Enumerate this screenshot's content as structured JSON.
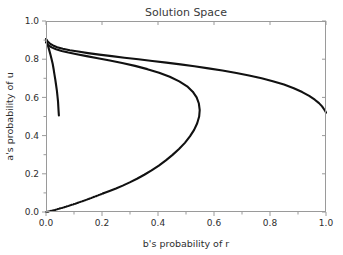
{
  "chart_data": {
    "type": "line",
    "title": "Solution Space",
    "xlabel": "b's probability of r",
    "ylabel": "a's probability of u",
    "xlim": [
      0.0,
      1.0
    ],
    "ylim": [
      0.0,
      1.0
    ],
    "grid": false,
    "legend": null,
    "xticks": [
      "0.0",
      "0.2",
      "0.4",
      "0.6",
      "0.8",
      "1.0"
    ],
    "xtick_values": [
      0.0,
      0.2,
      0.4,
      0.6,
      0.8,
      1.0
    ],
    "yticks": [
      "0.0",
      "0.2",
      "0.4",
      "0.6",
      "0.8",
      "1.0"
    ],
    "ytick_values": [
      0.0,
      0.2,
      0.4,
      0.6,
      0.8,
      1.0
    ],
    "line_color": "#111111",
    "series": [
      {
        "name": "upper-branch",
        "style": "solid",
        "points": [
          [
            0.0,
            0.905
          ],
          [
            0.006,
            0.893
          ],
          [
            0.014,
            0.882
          ],
          [
            0.025,
            0.872
          ],
          [
            0.04,
            0.863
          ],
          [
            0.06,
            0.855
          ],
          [
            0.085,
            0.847
          ],
          [
            0.115,
            0.84
          ],
          [
            0.15,
            0.832
          ],
          [
            0.19,
            0.824
          ],
          [
            0.235,
            0.816
          ],
          [
            0.28,
            0.808
          ],
          [
            0.33,
            0.8
          ],
          [
            0.38,
            0.791
          ],
          [
            0.43,
            0.782
          ],
          [
            0.48,
            0.773
          ],
          [
            0.53,
            0.763
          ],
          [
            0.58,
            0.752
          ],
          [
            0.63,
            0.741
          ],
          [
            0.68,
            0.728
          ],
          [
            0.725,
            0.715
          ],
          [
            0.77,
            0.7
          ],
          [
            0.81,
            0.685
          ],
          [
            0.85,
            0.667
          ],
          [
            0.885,
            0.648
          ],
          [
            0.915,
            0.628
          ],
          [
            0.94,
            0.608
          ],
          [
            0.96,
            0.588
          ],
          [
            0.975,
            0.57
          ],
          [
            0.986,
            0.553
          ],
          [
            0.993,
            0.538
          ],
          [
            0.998,
            0.527
          ],
          [
            1.0,
            0.52
          ]
        ]
      },
      {
        "name": "loop-branch",
        "style": "solid",
        "points": [
          [
            0.0,
            0.888
          ],
          [
            0.008,
            0.874
          ],
          [
            0.02,
            0.862
          ],
          [
            0.036,
            0.852
          ],
          [
            0.056,
            0.843
          ],
          [
            0.08,
            0.835
          ],
          [
            0.11,
            0.826
          ],
          [
            0.145,
            0.816
          ],
          [
            0.185,
            0.805
          ],
          [
            0.228,
            0.793
          ],
          [
            0.272,
            0.78
          ],
          [
            0.318,
            0.765
          ],
          [
            0.362,
            0.748
          ],
          [
            0.404,
            0.729
          ],
          [
            0.442,
            0.708
          ],
          [
            0.476,
            0.684
          ],
          [
            0.504,
            0.658
          ],
          [
            0.524,
            0.63
          ],
          [
            0.538,
            0.6
          ],
          [
            0.546,
            0.568
          ],
          [
            0.549,
            0.534
          ],
          [
            0.547,
            0.5
          ],
          [
            0.54,
            0.465
          ],
          [
            0.529,
            0.43
          ],
          [
            0.514,
            0.396
          ],
          [
            0.496,
            0.362
          ],
          [
            0.475,
            0.33
          ],
          [
            0.452,
            0.299
          ],
          [
            0.428,
            0.27
          ],
          [
            0.403,
            0.243
          ],
          [
            0.377,
            0.218
          ],
          [
            0.351,
            0.195
          ],
          [
            0.325,
            0.174
          ],
          [
            0.299,
            0.155
          ],
          [
            0.274,
            0.138
          ],
          [
            0.25,
            0.123
          ],
          [
            0.227,
            0.11
          ],
          [
            0.205,
            0.098
          ]
        ]
      },
      {
        "name": "loop-branch-tail",
        "style": "dotted",
        "points": [
          [
            0.205,
            0.098
          ],
          [
            0.186,
            0.087
          ],
          [
            0.168,
            0.077
          ],
          [
            0.152,
            0.068
          ],
          [
            0.137,
            0.06
          ],
          [
            0.123,
            0.053
          ],
          [
            0.11,
            0.046
          ],
          [
            0.098,
            0.04
          ],
          [
            0.087,
            0.035
          ],
          [
            0.077,
            0.03
          ],
          [
            0.068,
            0.026
          ],
          [
            0.059,
            0.022
          ],
          [
            0.051,
            0.019
          ],
          [
            0.044,
            0.016
          ],
          [
            0.037,
            0.013
          ],
          [
            0.031,
            0.01
          ],
          [
            0.025,
            0.008
          ],
          [
            0.02,
            0.006
          ],
          [
            0.015,
            0.005
          ],
          [
            0.011,
            0.003
          ],
          [
            0.007,
            0.002
          ],
          [
            0.004,
            0.001
          ],
          [
            0.0,
            0.0
          ]
        ]
      },
      {
        "name": "short-drop-branch",
        "style": "solid",
        "points": [
          [
            0.0,
            0.905
          ],
          [
            0.004,
            0.886
          ],
          [
            0.008,
            0.866
          ],
          [
            0.012,
            0.845
          ],
          [
            0.016,
            0.823
          ],
          [
            0.02,
            0.8
          ],
          [
            0.024,
            0.775
          ],
          [
            0.027,
            0.75
          ],
          [
            0.03,
            0.722
          ],
          [
            0.033,
            0.695
          ],
          [
            0.036,
            0.665
          ],
          [
            0.039,
            0.634
          ],
          [
            0.041,
            0.606
          ],
          [
            0.043,
            0.578
          ],
          [
            0.044,
            0.552
          ],
          [
            0.045,
            0.527
          ],
          [
            0.046,
            0.505
          ]
        ]
      }
    ]
  },
  "figure": {
    "background_color": "#ffffff",
    "frame_color": "#9a9a9a"
  }
}
